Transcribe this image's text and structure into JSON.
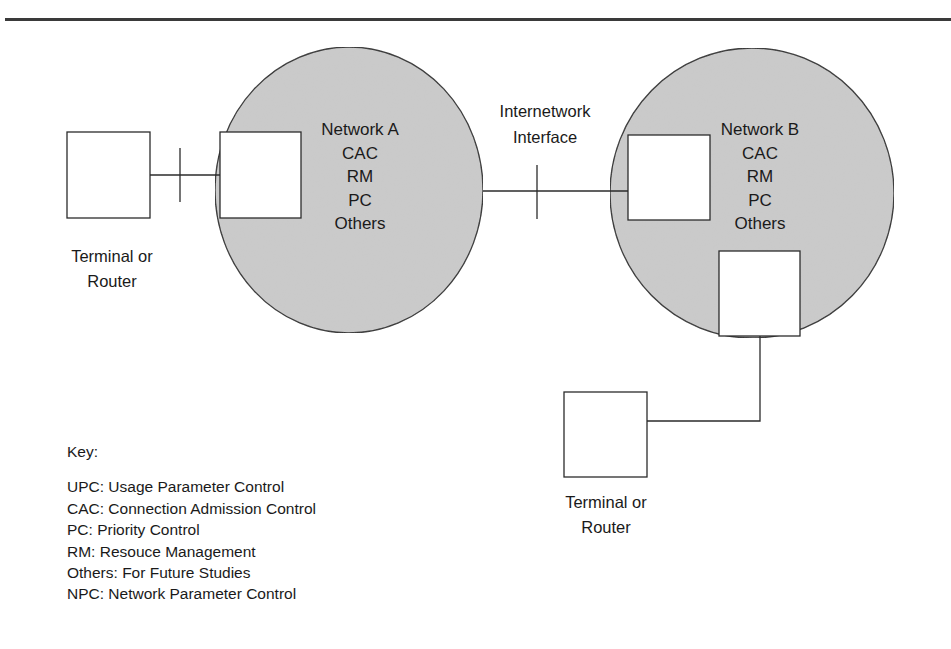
{
  "diagram": {
    "colors": {
      "network_fill": "#cbcbcb",
      "stroke": "#2b2b2b",
      "box_fill": "#ffffff"
    },
    "network_a": {
      "labels": [
        "Network A",
        "CAC",
        "RM",
        "PC",
        "Others"
      ]
    },
    "network_b": {
      "labels": [
        "Network B",
        "CAC",
        "RM",
        "PC",
        "Others"
      ]
    },
    "internetwork_interface": {
      "line1": "Internetwork",
      "line2": "Interface"
    },
    "terminal_left": {
      "line1": "Terminal or",
      "line2": "Router"
    },
    "terminal_bottom": {
      "line1": "Terminal or",
      "line2": "Router"
    },
    "key": {
      "title": "Key:",
      "entries": [
        "UPC: Usage Parameter Control",
        "CAC: Connection Admission Control",
        "PC: Priority Control",
        "RM: Resouce Management",
        "Others: For Future Studies",
        "NPC: Network Parameter Control"
      ]
    }
  }
}
